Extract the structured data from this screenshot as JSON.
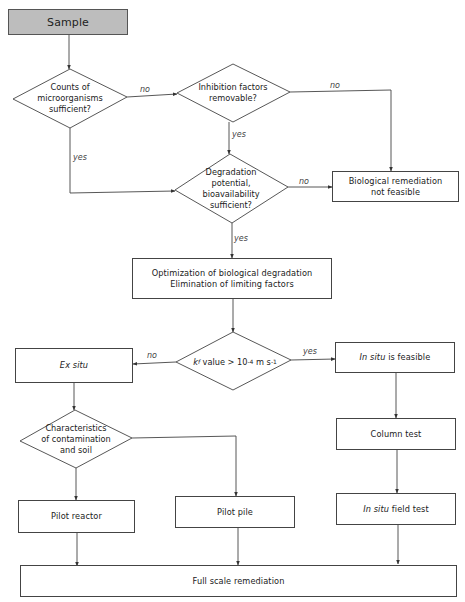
{
  "diagram": {
    "type": "flowchart",
    "colors": {
      "line": "#444444",
      "start_fill": "#bdbdbd",
      "box_fill": "#ffffff"
    },
    "nodes": {
      "sample": {
        "label": "Sample",
        "shape": "rect"
      },
      "counts": {
        "lines": [
          "Counts of",
          "microorganisms",
          "sufficient?"
        ],
        "shape": "diamond"
      },
      "inhibition": {
        "lines": [
          "Inhibition factors",
          "removable?"
        ],
        "shape": "diamond"
      },
      "degradation": {
        "lines": [
          "Degradation",
          "potential,",
          "bioavailability",
          "sufficient?"
        ],
        "shape": "diamond"
      },
      "not_feasible": {
        "lines": [
          "Biological remediation",
          "not feasible"
        ],
        "shape": "rect"
      },
      "optimization": {
        "lines": [
          "Optimization of biological degradation",
          "Elimination of limiting factors"
        ],
        "shape": "rect"
      },
      "kvalue": {
        "k": "k",
        "k_sub": "f",
        "text": " value > 10",
        "exp1": "-4",
        "unit": " m s",
        "exp2": "-1",
        "shape": "diamond"
      },
      "ex_situ": {
        "label": "Ex situ",
        "shape": "rect"
      },
      "in_situ": {
        "label_italic": "In situ",
        "label_rest": " is feasible",
        "shape": "rect"
      },
      "characteristics": {
        "lines": [
          "Characteristics",
          "of contamination",
          "and soil"
        ],
        "shape": "diamond"
      },
      "column_test": {
        "label": "Column test",
        "shape": "rect"
      },
      "pilot_reactor": {
        "label": "Pilot reactor",
        "shape": "rect"
      },
      "pilot_pile": {
        "label": "Pilot pile",
        "shape": "rect"
      },
      "field_test": {
        "label_italic": "In situ",
        "label_rest": " field test",
        "shape": "rect"
      },
      "full_scale": {
        "label": "Full scale remediation",
        "shape": "rect"
      }
    },
    "edge_labels": {
      "counts_no": "no",
      "counts_yes": "yes",
      "inhibition_no": "no",
      "inhibition_yes": "yes",
      "degradation_no": "no",
      "degradation_yes": "yes",
      "kvalue_no": "no",
      "kvalue_yes": "yes"
    },
    "edges": [
      {
        "from": "sample",
        "to": "counts"
      },
      {
        "from": "counts",
        "to": "inhibition",
        "label": "no"
      },
      {
        "from": "counts",
        "to": "degradation",
        "label": "yes"
      },
      {
        "from": "inhibition",
        "to": "degradation",
        "label": "yes"
      },
      {
        "from": "inhibition",
        "to": "not_feasible",
        "label": "no"
      },
      {
        "from": "degradation",
        "to": "not_feasible",
        "label": "no"
      },
      {
        "from": "degradation",
        "to": "optimization",
        "label": "yes"
      },
      {
        "from": "optimization",
        "to": "kvalue"
      },
      {
        "from": "kvalue",
        "to": "ex_situ",
        "label": "no"
      },
      {
        "from": "kvalue",
        "to": "in_situ",
        "label": "yes"
      },
      {
        "from": "ex_situ",
        "to": "characteristics"
      },
      {
        "from": "characteristics",
        "to": "pilot_reactor"
      },
      {
        "from": "characteristics",
        "to": "pilot_pile"
      },
      {
        "from": "in_situ",
        "to": "column_test"
      },
      {
        "from": "column_test",
        "to": "field_test"
      },
      {
        "from": "pilot_reactor",
        "to": "full_scale"
      },
      {
        "from": "pilot_pile",
        "to": "full_scale"
      },
      {
        "from": "field_test",
        "to": "full_scale"
      }
    ]
  }
}
